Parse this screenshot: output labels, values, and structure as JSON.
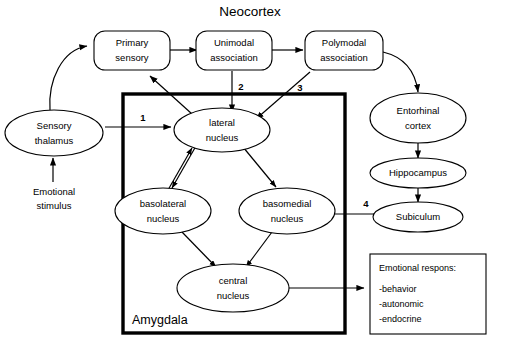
{
  "diagram": {
    "title": "Neocortex",
    "region_box_label": "Amygdala",
    "nodes": {
      "primary_sensory": "Primary\nsensory",
      "primary_sensory_l1": "Primary",
      "primary_sensory_l2": "sensory",
      "unimodal": "Unimodal\nassociation",
      "unimodal_l1": "Unimodal",
      "unimodal_l2": "association",
      "polymodal": "Polymodal\nassociation",
      "polymodal_l1": "Polymodal",
      "polymodal_l2": "association",
      "sensory_thalamus_l1": "Sensory",
      "sensory_thalamus_l2": "thalamus",
      "lateral_l1": "lateral",
      "lateral_l2": "nucleus",
      "basolateral_l1": "basolateral",
      "basolateral_l2": "nucleus",
      "basomedial_l1": "basomedial",
      "basomedial_l2": "nucleus",
      "central_l1": "central",
      "central_l2": "nucleus",
      "entorhinal_l1": "Entorhinal",
      "entorhinal_l2": "cortex",
      "hippocampus": "Hippocampus",
      "subiculum": "Subiculum"
    },
    "free_text": {
      "emotional_stimulus_l1": "Emotional",
      "emotional_stimulus_l2": "stimulus"
    },
    "pathway_numbers": {
      "one": "1",
      "two": "2",
      "three": "3",
      "four": "4"
    },
    "response_box": {
      "heading": "Emotional respons:",
      "items": [
        "-behavior",
        "-autonomic",
        "-endocrine"
      ]
    },
    "colors": {
      "stroke": "#000000",
      "background": "#ffffff"
    }
  }
}
